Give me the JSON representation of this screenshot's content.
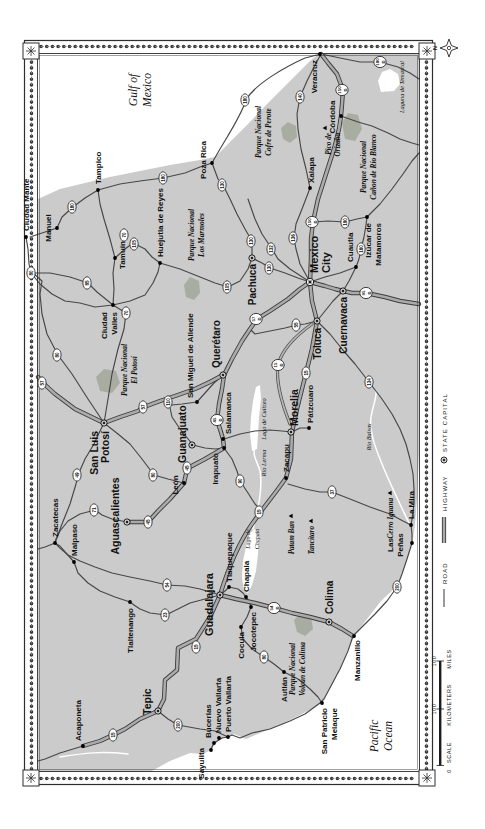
{
  "map": {
    "colors": {
      "land": "#cbcbcb",
      "water": "#ffffff",
      "park": "#a9ada1",
      "road": "#474747",
      "highway": "#ababab",
      "ink": "#111111"
    },
    "compass": {
      "n": "N"
    },
    "scale": {
      "label": "SCALE",
      "zero": "0",
      "km": "100",
      "km_unit": "KILOMETERS",
      "mi": "100",
      "mi_unit": "MILES"
    },
    "legend": {
      "road": "ROAD",
      "highway": "HIGHWAY",
      "state_capital": "STATE CAPITAL"
    },
    "capitals": [
      {
        "n": "Pachuca",
        "x": 571,
        "y": 252,
        "lx": 565,
        "ly": 256,
        "a": "end",
        "s": 10
      },
      {
        "n": "Mexico",
        "n2": "City",
        "x": 547,
        "y": 310,
        "lx": 556,
        "ly": 318,
        "lx2": 556,
        "ly2": 330,
        "a": "start",
        "s": 11
      },
      {
        "n": "Toluca",
        "x": 508,
        "y": 317,
        "lx": 501,
        "ly": 321,
        "a": "end",
        "s": 10
      },
      {
        "n": "Cuernavaca",
        "x": 538,
        "y": 343,
        "lx": 532,
        "ly": 347,
        "a": "end",
        "s": 10
      },
      {
        "n": "Querétaro",
        "x": 454,
        "y": 223,
        "lx": 461,
        "ly": 220,
        "a": "start",
        "s": 10
      },
      {
        "n": "Guanajuato",
        "x": 384,
        "y": 192,
        "lx": 366,
        "ly": 186,
        "a": "start",
        "s": 10.5
      },
      {
        "n": "San Luis",
        "n2": "Potosí",
        "x": 406,
        "y": 104,
        "lx": 398,
        "ly": 98,
        "lx2": 398,
        "ly2": 109,
        "a": "end",
        "s": 10.5
      },
      {
        "n": "Aguascalientes",
        "x": 307,
        "y": 127,
        "lx": 313,
        "ly": 119,
        "a": "middle",
        "s": 10.5
      },
      {
        "n": "Morelia",
        "x": 397,
        "y": 291,
        "lx": 403,
        "ly": 298,
        "a": "start",
        "s": 10.5
      },
      {
        "n": "Guadalajara",
        "x": 234,
        "y": 220,
        "lx": 256,
        "ly": 213,
        "a": "end",
        "s": 11
      },
      {
        "n": "Tepic",
        "x": 118,
        "y": 158,
        "lx": 114,
        "ly": 151,
        "a": "start",
        "s": 10.5
      },
      {
        "n": "Colima",
        "x": 207,
        "y": 329,
        "lx": 215,
        "ly": 333,
        "a": "start",
        "s": 10
      }
    ],
    "towns": [
      {
        "n": "Ciudad Mante",
        "x": 592,
        "y": 26,
        "lx": 598,
        "ly": 29,
        "a": "start"
      },
      {
        "n": "Manuel",
        "x": 601,
        "y": 57,
        "lx": 601,
        "ly": 51,
        "a": "middle"
      },
      {
        "n": "Tampico",
        "x": 639,
        "y": 98,
        "lx": 645,
        "ly": 101,
        "a": "start"
      },
      {
        "n": "Tamuín",
        "x": 571,
        "y": 115,
        "lx": 574,
        "ly": 125,
        "a": "middle"
      },
      {
        "n": "Ciudad",
        "n2": "Valles",
        "x": 524,
        "y": 113,
        "lx": 517,
        "ly": 107,
        "lx2": 517,
        "ly2": 117,
        "a": "end"
      },
      {
        "n": "Huejutla de Reyes",
        "x": 566,
        "y": 160,
        "lx": 572,
        "ly": 163,
        "a": "start"
      },
      {
        "n": "Poza Rica",
        "x": 666,
        "y": 212,
        "lx": 669,
        "ly": 206,
        "a": "middle"
      },
      {
        "n": "Xalapa",
        "x": 641,
        "y": 310,
        "lx": 646,
        "ly": 314,
        "a": "start"
      },
      {
        "n": "Veracruz",
        "x": 775,
        "y": 320,
        "lx": 769,
        "ly": 317,
        "a": "end"
      },
      {
        "n": "Córdoba",
        "x": 713,
        "y": 341,
        "lx": 712,
        "ly": 335,
        "a": "middle"
      },
      {
        "n": "Cuautla",
        "x": 562,
        "y": 356,
        "lx": 567,
        "ly": 353,
        "a": "start"
      },
      {
        "n": "Izúcar de",
        "n2": "Matamoros",
        "x": 612,
        "y": 367,
        "lx": 606,
        "ly": 371,
        "lx2": 606,
        "ly2": 381,
        "a": "end"
      },
      {
        "n": "San Miguel de Allende",
        "x": 427,
        "y": 197,
        "lx": 431,
        "ly": 193,
        "a": "start"
      },
      {
        "n": "Salamanca",
        "x": 390,
        "y": 223,
        "lx": 395,
        "ly": 231,
        "a": "start"
      },
      {
        "n": "Irapuato",
        "x": 381,
        "y": 224,
        "lx": 376,
        "ly": 218,
        "a": "end"
      },
      {
        "n": "León",
        "x": 346,
        "y": 184,
        "lx": 344,
        "ly": 178,
        "a": "middle"
      },
      {
        "n": "Pátzcuaro",
        "x": 401,
        "y": 309,
        "lx": 406,
        "ly": 313,
        "a": "start"
      },
      {
        "n": "Zacapu",
        "x": 351,
        "y": 286,
        "lx": 357,
        "ly": 289,
        "a": "start"
      },
      {
        "n": "Zacatecas",
        "x": 286,
        "y": 55,
        "lx": 292,
        "ly": 58,
        "a": "start"
      },
      {
        "n": "Malpaso",
        "x": 267,
        "y": 74,
        "lx": 273,
        "ly": 77,
        "a": "start"
      },
      {
        "n": "Tlaltenango",
        "x": 227,
        "y": 130,
        "lx": 221,
        "ly": 133,
        "a": "end"
      },
      {
        "n": "Tlaquepaque",
        "x": 242,
        "y": 229,
        "lx": 247,
        "ly": 232,
        "a": "start"
      },
      {
        "n": "Chapala",
        "x": 232,
        "y": 246,
        "lx": 237,
        "ly": 249,
        "a": "start"
      },
      {
        "n": "Jocotepec",
        "x": 222,
        "y": 251,
        "lx": 217,
        "ly": 256,
        "a": "end"
      },
      {
        "n": "Cocula",
        "x": 202,
        "y": 241,
        "lx": 197,
        "ly": 244,
        "a": "end"
      },
      {
        "n": "Autlán",
        "x": 157,
        "y": 284,
        "lx": 152,
        "ly": 287,
        "a": "end"
      },
      {
        "n": "Manzanillo",
        "x": 193,
        "y": 354,
        "lx": 189,
        "ly": 360,
        "a": "end"
      },
      {
        "n": "San Patricio",
        "n2": "Melaque",
        "x": 126,
        "y": 322,
        "lx": 121,
        "ly": 327,
        "lx2": 121,
        "ly2": 337,
        "a": "end"
      },
      {
        "n": "Las",
        "n2": "Peñas",
        "x": 286,
        "y": 412,
        "lx": 284,
        "ly": 393,
        "lx2": 284,
        "ly2": 403,
        "a": "middle"
      },
      {
        "n": "La Mira",
        "x": 304,
        "y": 411,
        "lx": 310,
        "ly": 414,
        "a": "start"
      },
      {
        "n": "Acaponeta",
        "x": 83,
        "y": 83,
        "lx": 88,
        "ly": 81,
        "a": "start"
      },
      {
        "n": "Sayulita",
        "x": 79,
        "y": 211,
        "lx": 81,
        "ly": 204,
        "a": "end"
      },
      {
        "n": "Bucerias",
        "x": 86,
        "y": 214,
        "lx": 91,
        "ly": 211,
        "a": "start"
      },
      {
        "n": "Nuevo Vallarta",
        "x": 91,
        "y": 219,
        "lx": 96,
        "ly": 221,
        "a": "start"
      },
      {
        "n": "Puerto Vallarta",
        "x": 92,
        "y": 228,
        "lx": 97,
        "ly": 231,
        "a": "start"
      }
    ],
    "peaks": [
      {
        "n": "Pico de",
        "n2": "Orizaba",
        "x": 701,
        "y": 325,
        "lx": 696,
        "ly": 331,
        "lx2": 696,
        "ly2": 340
      },
      {
        "n": "Cerro Iguana",
        "x": 336,
        "y": 390,
        "lx": 331,
        "ly": 393
      },
      {
        "n": "Patam Ban",
        "x": 313,
        "y": 291,
        "lx": 308,
        "ly": 294
      },
      {
        "n": "Tancítaro",
        "x": 308,
        "y": 311,
        "lx": 303,
        "ly": 314
      }
    ],
    "parks": [
      {
        "l1": "Parque Nacional",
        "l2": "El Potosí",
        "x": 459,
        "y1": 127,
        "y2": 137
      },
      {
        "l1": "Parque Nacional",
        "l2": "Los Marmoles",
        "x": 594,
        "y1": 194,
        "y2": 204
      },
      {
        "l1": "Parque Nacional",
        "l2": "Cofre de Perote",
        "x": 697,
        "y1": 261,
        "y2": 271
      },
      {
        "l1": "Parque Nacional",
        "l2": "Cañon de Río Blanco",
        "x": 662,
        "y1": 366,
        "y2": 376
      },
      {
        "l1": "Parque Nacional",
        "l2": "Volcán de Colima",
        "x": 160,
        "y1": 295,
        "y2": 305
      }
    ],
    "waters": [
      {
        "l1": "Gulf of",
        "l2": "Mexico",
        "x": 739,
        "y1": 137,
        "y2": 151,
        "s": 11.5
      },
      {
        "l1": "Pacific",
        "l2": "Ocean",
        "x": 93,
        "y1": 378,
        "y2": 392,
        "s": 11.5
      },
      {
        "l1": "Laguna de Temazcal",
        "x": 742,
        "y1": 404,
        "s": 6.3
      },
      {
        "l1": "Lago de Cuitzeo",
        "x": 410,
        "y1": 266,
        "s": 6.3
      },
      {
        "l1": "Río Lerma",
        "x": 366,
        "y1": 266,
        "s": 6.3
      },
      {
        "l1": "Lago de",
        "l2": "Chapala",
        "x": 290,
        "y1": 250,
        "y2": 259,
        "s": 6
      },
      {
        "l1": "Río Balsas",
        "x": 392,
        "y1": 371,
        "s": 6.3
      }
    ],
    "shields": [
      {
        "n": "180",
        "x": 622,
        "y": 72
      },
      {
        "n": "80",
        "x": 556,
        "y": 31
      },
      {
        "n": "85",
        "x": 546,
        "y": 87
      },
      {
        "n": "70",
        "x": 594,
        "y": 124
      },
      {
        "n": "105",
        "x": 585,
        "y": 134
      },
      {
        "n": "70",
        "x": 516,
        "y": 126
      },
      {
        "n": "80",
        "x": 474,
        "y": 57
      },
      {
        "n": "57",
        "x": 446,
        "y": 42
      },
      {
        "n": "49",
        "x": 354,
        "y": 77
      },
      {
        "n": "71",
        "x": 319,
        "y": 94
      },
      {
        "n": "80",
        "x": 354,
        "y": 153
      },
      {
        "n": "45",
        "x": 307,
        "y": 148
      },
      {
        "n": "57",
        "x": 422,
        "y": 143
      },
      {
        "n": "110",
        "x": 427,
        "y": 168
      },
      {
        "n": "45",
        "x": 361,
        "y": 187
      },
      {
        "n": "45",
        "x": 409,
        "y": 217,
        "toll": true
      },
      {
        "n": "90",
        "x": 348,
        "y": 240
      },
      {
        "n": "180",
        "x": 651,
        "y": 163
      },
      {
        "n": "130",
        "x": 644,
        "y": 222
      },
      {
        "n": "130",
        "x": 588,
        "y": 251
      },
      {
        "n": "105",
        "x": 542,
        "y": 227
      },
      {
        "n": "132",
        "x": 580,
        "y": 271
      },
      {
        "n": "136",
        "x": 591,
        "y": 293
      },
      {
        "n": "130",
        "x": 561,
        "y": 269
      },
      {
        "n": "57",
        "x": 510,
        "y": 256,
        "toll": true
      },
      {
        "n": "55",
        "x": 504,
        "y": 296
      },
      {
        "n": "15",
        "x": 464,
        "y": 278,
        "toll": true
      },
      {
        "n": "15",
        "x": 456,
        "y": 306
      },
      {
        "n": "134",
        "x": 447,
        "y": 369
      },
      {
        "n": "95",
        "x": 536,
        "y": 366,
        "toll": true
      },
      {
        "n": "150",
        "x": 607,
        "y": 312,
        "toll": true
      },
      {
        "n": "190",
        "x": 607,
        "y": 345
      },
      {
        "n": "160",
        "x": 580,
        "y": 361
      },
      {
        "n": "140",
        "x": 732,
        "y": 300
      },
      {
        "n": "180",
        "x": 729,
        "y": 245
      },
      {
        "n": "180",
        "x": 767,
        "y": 380,
        "toll": true
      },
      {
        "n": "150",
        "x": 739,
        "y": 342,
        "toll": true
      },
      {
        "n": "37",
        "x": 337,
        "y": 332
      },
      {
        "n": "15",
        "x": 317,
        "y": 259
      },
      {
        "n": "200",
        "x": 242,
        "y": 397
      },
      {
        "n": "54",
        "x": 244,
        "y": 167
      },
      {
        "n": "23",
        "x": 214,
        "y": 165
      },
      {
        "n": "54",
        "x": 221,
        "y": 274,
        "toll": true
      },
      {
        "n": "80",
        "x": 172,
        "y": 264
      },
      {
        "n": "15",
        "x": 182,
        "y": 196
      },
      {
        "n": "200",
        "x": 104,
        "y": 178
      },
      {
        "n": "15",
        "x": 94,
        "y": 113
      }
    ]
  }
}
